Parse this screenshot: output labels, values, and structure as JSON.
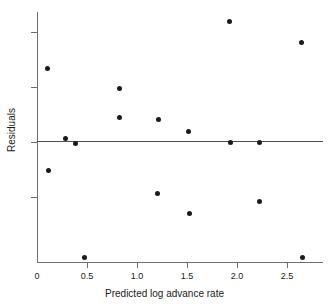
{
  "chart_data": {
    "type": "scatter",
    "title": "",
    "xlabel": "Predicted log advance rate",
    "ylabel": "Residuals",
    "xlim": [
      0,
      2.86
    ],
    "ylim": [
      -0.222,
      0.233
    ],
    "grid": false,
    "legend": null,
    "reference_line": {
      "orientation": "horizontal",
      "y": 0
    },
    "xticks": [
      0,
      0.5,
      1.0,
      1.5,
      2.0,
      2.5
    ],
    "xtick_labels": [
      "0",
      "0.5",
      "1.0",
      "1.5",
      "2.0",
      "2.5"
    ],
    "yticks": [
      0.2,
      0.1,
      0,
      -0.1
    ],
    "ytick_labels": [
      "0.2",
      "0.1",
      "0",
      "-0.1"
    ],
    "marker": "filled-circle",
    "marker_color": "#1a1a1a",
    "points": [
      {
        "x": 0.1,
        "y": 0.133
      },
      {
        "x": 0.11,
        "y": -0.053
      },
      {
        "x": 0.28,
        "y": 0.005
      },
      {
        "x": 0.38,
        "y": -0.003
      },
      {
        "x": 0.47,
        "y": -0.211
      },
      {
        "x": 0.82,
        "y": 0.096
      },
      {
        "x": 0.82,
        "y": 0.043
      },
      {
        "x": 1.21,
        "y": 0.04
      },
      {
        "x": 1.2,
        "y": -0.095
      },
      {
        "x": 1.51,
        "y": 0.018
      },
      {
        "x": 1.52,
        "y": -0.131
      },
      {
        "x": 1.92,
        "y": 0.219
      },
      {
        "x": 1.93,
        "y": -0.001
      },
      {
        "x": 2.22,
        "y": -0.001
      },
      {
        "x": 2.22,
        "y": -0.109
      },
      {
        "x": 2.64,
        "y": 0.18
      },
      {
        "x": 2.65,
        "y": -0.21
      }
    ]
  },
  "axes": {
    "x_title": "Predicted log advance rate",
    "y_title": "Residuals",
    "x_tick_labels": [
      "0",
      "0.5",
      "1.0",
      "1.5",
      "2.0",
      "2.5"
    ],
    "y_tick_labels": [
      "0.2",
      "0.1",
      "0",
      "-0.1"
    ]
  },
  "colors": {
    "marker": "#1a1a1a",
    "axis": "#6e6e6e",
    "reference_line": "#4d4d4d",
    "background": "#ffffff",
    "text": "#1a1a1a"
  }
}
